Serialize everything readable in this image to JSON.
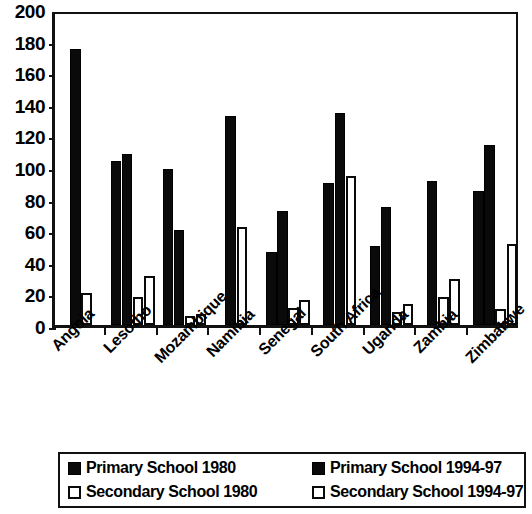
{
  "chart_data": {
    "type": "bar",
    "title": "",
    "xlabel": "",
    "ylabel": "",
    "ylim": [
      0,
      200
    ],
    "ytick_step": 20,
    "yticks": [
      "200",
      "180",
      "160",
      "140",
      "120",
      "100",
      "80",
      "60",
      "40",
      "20",
      "0"
    ],
    "grid": false,
    "legend_position": "bottom",
    "categories": [
      "Angola",
      "Lesotho",
      "Mozambique",
      "Namibia",
      "Senegal",
      "South Africa",
      "Uganda",
      "Zambia",
      "Zimbabwe"
    ],
    "series": [
      {
        "name": "Primary School 1980",
        "style": "filled-black",
        "values": [
          175,
          104,
          99,
          132,
          46,
          90,
          50,
          91,
          85
        ]
      },
      {
        "name": "Primary School 1994-97",
        "style": "filled-black",
        "values": [
          null,
          108,
          60,
          null,
          72,
          134,
          75,
          null,
          114
        ]
      },
      {
        "name": "Secondary School 1980",
        "style": "white-outline",
        "values": [
          20,
          18,
          6,
          62,
          11,
          null,
          8,
          18,
          10
        ]
      },
      {
        "name": "Secondary School 1994-97",
        "style": "white-outline",
        "values": [
          null,
          31,
          7,
          null,
          16,
          94,
          13,
          29,
          51
        ]
      }
    ]
  },
  "axis": {
    "y_labels": [
      "200",
      "180",
      "160",
      "140",
      "120",
      "100",
      "80",
      "60",
      "40",
      "20",
      "0"
    ]
  },
  "categories": [
    {
      "label": "Angola"
    },
    {
      "label": "Lesotho"
    },
    {
      "label": "Mozambique"
    },
    {
      "label": "Namibia"
    },
    {
      "label": "Senegal"
    },
    {
      "label": "South Africa"
    },
    {
      "label": "Uganda"
    },
    {
      "label": "Zambia"
    },
    {
      "label": "Zimbabwe"
    }
  ],
  "legend": {
    "items": [
      {
        "label": "Primary School 1980",
        "style": "dark"
      },
      {
        "label": "Primary School 1994-97",
        "style": "dark"
      },
      {
        "label": "Secondary School 1980",
        "style": "light"
      },
      {
        "label": "Secondary School 1994-97",
        "style": "light"
      }
    ]
  }
}
